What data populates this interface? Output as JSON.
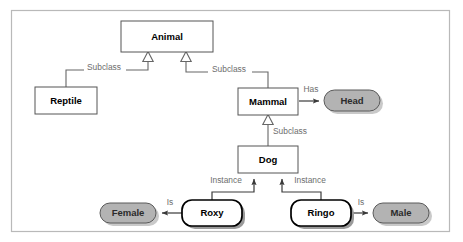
{
  "diagram": {
    "frame": {
      "x": 11,
      "y": 10,
      "width": 439,
      "height": 222
    },
    "colors": {
      "background": "#ffffff",
      "frame_border": "#b9b9b9",
      "class_box_fill": "#ffffff",
      "class_box_border": "#555555",
      "value_box_fill": "#b3b3b3",
      "value_box_border": "#5a5a5a",
      "instance_box_border": "#000000",
      "connector": "#666666",
      "edge_label_text": "#6d6d6d",
      "node_label_text": "#000000"
    },
    "nodes": [
      {
        "id": "animal",
        "label": "Animal",
        "kind": "class",
        "shape": "rectangle",
        "x": 121,
        "y": 21,
        "width": 92,
        "height": 31
      },
      {
        "id": "reptile",
        "label": "Reptile",
        "kind": "class",
        "shape": "rectangle",
        "x": 35,
        "y": 87,
        "width": 62,
        "height": 27
      },
      {
        "id": "mammal",
        "label": "Mammal",
        "kind": "class",
        "shape": "rectangle",
        "x": 238,
        "y": 88,
        "width": 60,
        "height": 27
      },
      {
        "id": "head",
        "label": "Head",
        "kind": "value",
        "shape": "stadium",
        "x": 324,
        "y": 90,
        "width": 56,
        "height": 21
      },
      {
        "id": "dog",
        "label": "Dog",
        "kind": "class",
        "shape": "rectangle",
        "x": 238,
        "y": 146,
        "width": 60,
        "height": 27
      },
      {
        "id": "roxy",
        "label": "Roxy",
        "kind": "instance",
        "shape": "rounded-rectangle",
        "x": 182,
        "y": 200,
        "width": 60,
        "height": 26
      },
      {
        "id": "ringo",
        "label": "Ringo",
        "kind": "instance",
        "shape": "rounded-rectangle",
        "x": 291,
        "y": 200,
        "width": 60,
        "height": 26
      },
      {
        "id": "female",
        "label": "Female",
        "kind": "value",
        "shape": "stadium",
        "x": 100,
        "y": 203,
        "width": 56,
        "height": 20
      },
      {
        "id": "male",
        "label": "Male",
        "kind": "value",
        "shape": "stadium",
        "x": 373,
        "y": 203,
        "width": 56,
        "height": 20
      }
    ],
    "edges": [
      {
        "id": "reptile-animal",
        "label": "Subclass",
        "from": "reptile",
        "to": "animal",
        "arrow": "hollow-triangle",
        "label_x": 104,
        "label_y": 68
      },
      {
        "id": "mammal-animal",
        "label": "Subclass",
        "from": "mammal",
        "to": "animal",
        "arrow": "hollow-triangle",
        "label_x": 229,
        "label_y": 70
      },
      {
        "id": "dog-mammal",
        "label": "Subclass",
        "from": "dog",
        "to": "mammal",
        "arrow": "hollow-triangle",
        "label_x": 290,
        "label_y": 132
      },
      {
        "id": "mammal-head",
        "label": "Has",
        "from": "mammal",
        "to": "head",
        "arrow": "solid",
        "label_x": 311,
        "label_y": 90
      },
      {
        "id": "roxy-dog",
        "label": "Instance",
        "from": "roxy",
        "to": "dog",
        "arrow": "solid",
        "label_x": 226,
        "label_y": 181
      },
      {
        "id": "ringo-dog",
        "label": "Instance",
        "from": "ringo",
        "to": "dog",
        "arrow": "solid",
        "label_x": 310,
        "label_y": 181
      },
      {
        "id": "roxy-female",
        "label": "Is",
        "from": "roxy",
        "to": "female",
        "arrow": "solid",
        "label_x": 170,
        "label_y": 203
      },
      {
        "id": "ringo-male",
        "label": "Is",
        "from": "ringo",
        "to": "male",
        "arrow": "solid",
        "label_x": 361,
        "label_y": 203
      }
    ]
  }
}
